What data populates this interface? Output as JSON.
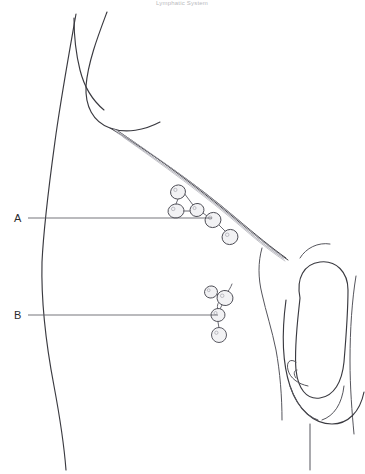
{
  "figure": {
    "title": "Lymphatic System",
    "title_visible": "partially cut off at top edge",
    "style": "black and white medical line drawing",
    "width": 365,
    "height": 474,
    "background_color": "#ffffff",
    "line_color": "#3a3a40"
  },
  "labels": [
    {
      "id": "A",
      "text": "A",
      "description": "superficial inguinal lymph nodes",
      "text_x": 14,
      "text_y": 222,
      "leader_x1": 28,
      "leader_y1": 218,
      "leader_x2": 212,
      "leader_y2": 218
    },
    {
      "id": "B",
      "text": "B",
      "description": "deep inguinal / femoral lymph nodes",
      "text_x": 14,
      "text_y": 319,
      "leader_x1": 28,
      "leader_y1": 315,
      "leader_x2": 218,
      "leader_y2": 315
    }
  ],
  "clusters": {
    "A": {
      "label": "A",
      "node_count": 5,
      "arrangement": "branching chain along inguinal ligament",
      "nodes": [
        {
          "cx": 178,
          "cy": 192,
          "rx": 7.5,
          "ry": 7.0,
          "rot": -20
        },
        {
          "cx": 176,
          "cy": 211,
          "rx": 8.0,
          "ry": 7.0,
          "rot": -10
        },
        {
          "cx": 197,
          "cy": 210,
          "rx": 7.0,
          "ry": 6.5,
          "rot": -15
        },
        {
          "cx": 213,
          "cy": 220,
          "rx": 8.0,
          "ry": 7.5,
          "rot": -20
        },
        {
          "cx": 230,
          "cy": 237,
          "rx": 8.0,
          "ry": 7.5,
          "rot": -20
        }
      ],
      "connections": [
        [
          178,
          199,
          176,
          204
        ],
        [
          184,
          193,
          193,
          205
        ],
        [
          183,
          211,
          190,
          211
        ],
        [
          203,
          213,
          207,
          216
        ],
        [
          219,
          225,
          225,
          231
        ]
      ]
    },
    "B": {
      "label": "B",
      "node_count": 4,
      "arrangement": "vertical chain with curved afferent vessel",
      "nodes": [
        {
          "cx": 211,
          "cy": 292,
          "rx": 6.5,
          "ry": 6.0,
          "rot": -15
        },
        {
          "cx": 225,
          "cy": 298,
          "rx": 8.0,
          "ry": 7.5,
          "rot": 15
        },
        {
          "cx": 218,
          "cy": 315,
          "rx": 7.0,
          "ry": 6.5,
          "rot": -10
        },
        {
          "cx": 219,
          "cy": 335,
          "rx": 7.5,
          "ry": 7.5,
          "rot": 0
        }
      ],
      "connections": [
        [
          217,
          294,
          219,
          296
        ],
        [
          222,
          305,
          220,
          309
        ],
        [
          218,
          322,
          219,
          328
        ]
      ],
      "vessel_path": "M 232 284 C 229 292 224 296 219 302 C 216 306 218 310 219 314"
    }
  },
  "anatomy": {
    "torso_left_edge": "M 76 14 C 70 48 62 92 56 134 C 50 178 44 220 42 262 C 41 302 46 344 54 386 C 60 418 64 444 66 470",
    "iliac_crest": "M 107 12 C 98 36 88 62 86 86 C 85 106 93 122 110 128 C 126 134 145 130 160 122",
    "hip_inner": "M 74 18 C 74 36 76 54 80 70 C 84 86 92 100 104 110",
    "inguinal_dark_upper": "M 110 128 C 150 152 196 184 236 218 C 256 235 272 248 286 258",
    "inguinal_dark_lower": "M 118 131 C 158 158 204 192 244 226 C 262 241 276 252 288 260",
    "ligament_fibers": [
      "M 114 129 C 152 153 198 186 238 220 C 256 236 270 248 282 256",
      "M 116 132 C 154 157 200 190 240 224 C 257 239 271 250 283 258",
      "M 120 134 C 158 160 204 193 243 227 C 259 241 272 251 284 259",
      "M 123 137 C 160 163 206 196 245 230 C 260 243 273 253 285 261"
    ],
    "thigh_crease": "M 262 248 C 258 262 258 278 262 294 C 266 312 272 330 276 350 C 280 372 282 396 282 420",
    "thigh_outer_right": "M 356 276 C 352 300 350 330 350 360 C 350 388 352 412 354 434",
    "scrotum_outline": "M 286 300 C 282 330 282 362 290 386 C 298 410 314 424 332 424 C 348 424 360 412 364 392",
    "penis_outline": "M 300 298 C 296 278 304 264 320 262 C 336 260 348 272 348 290 C 348 310 346 338 344 362 C 342 382 334 396 320 398 C 306 400 298 388 296 370 C 294 346 298 318 300 298",
    "glans_outline": "M 296 362 C 290 358 286 362 288 370 C 290 378 298 384 308 386",
    "glans_inner": "M 297 370 C 294 370 293 374 296 378",
    "scrotum_left_lobe": "M 290 386 C 296 404 306 416 318 420",
    "scrotum_right_lobe": "M 344 386 C 342 404 334 416 322 420",
    "raphe_line": "M 310 424 L 310 470",
    "thigh_right_edge": "M 300 258 C 306 248 318 242 330 244"
  }
}
